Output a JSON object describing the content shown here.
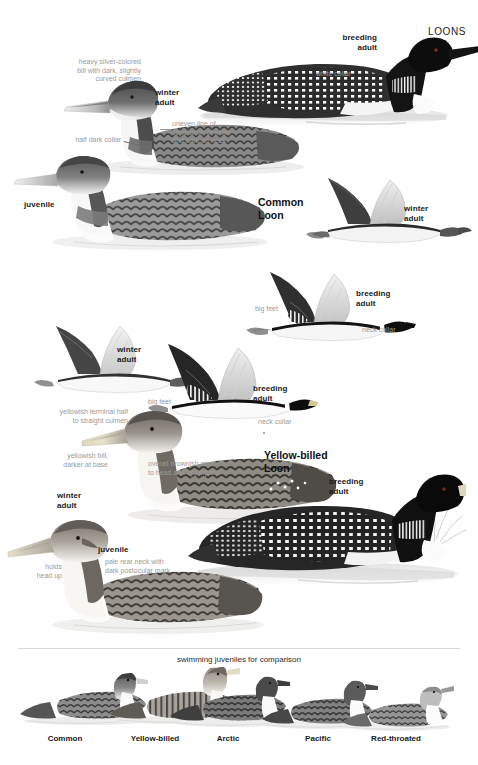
{
  "plate": {
    "title": "LOONS",
    "background": "#ffffff",
    "label_color": "#1a1a1a",
    "annotation_color": "#9a9a9a"
  },
  "species_headings": [
    {
      "name": "Common Loon",
      "text": "Common\nLoon"
    },
    {
      "name": "Yellow-billed Loon",
      "text": "Yellow-billed\nLoon"
    }
  ],
  "common_loon": {
    "breeding_adult_swimming": {
      "age_label": "breeding\nadult",
      "annotations": [
        {
          "name": "white-collar",
          "text": "white collar"
        }
      ]
    },
    "winter_adult_swimming": {
      "age_label": "winter\nadult",
      "annotations": [
        {
          "name": "bill-note",
          "text": "heavy silver-colored\nbill with dark, slightly\ncurved culmen"
        },
        {
          "name": "collar-note",
          "text": "half dark collar"
        },
        {
          "name": "neck-separation-note",
          "text": "uneven line of\nseparation of white\nand dark on neck"
        }
      ]
    },
    "juvenile_swimming": {
      "age_label": "juvenile"
    },
    "winter_adult_flight": {
      "age_label": "winter\nadult"
    },
    "breeding_adult_flight": {
      "age_label": "breeding\nadult",
      "annotations": [
        {
          "name": "big-feet",
          "text": "big feet"
        },
        {
          "name": "neck-collar",
          "text": "neck collar"
        }
      ]
    }
  },
  "yellow_billed_loon": {
    "winter_adult_flight": {
      "age_label": "winter\nadult"
    },
    "breeding_adult_flight": {
      "age_label": "breeding\nadult",
      "annotations": [
        {
          "name": "big-feet",
          "text": "big feet"
        },
        {
          "name": "neck-collar",
          "text": "neck collar"
        }
      ]
    },
    "winter_adult_swimming": {
      "age_label": "winter\nadult",
      "annotations": [
        {
          "name": "culmen-note",
          "text": "yellowish terminal half\nto straight culmen"
        },
        {
          "name": "bill-note",
          "text": "yellowish bill,\ndarker at base"
        },
        {
          "name": "brownish-cast-note",
          "text": "overall brownish cast\nto head and upperparts"
        }
      ]
    },
    "juvenile_swimming": {
      "age_label": "juvenile",
      "annotations": [
        {
          "name": "head-posture-note",
          "text": "holds\nhead up"
        },
        {
          "name": "rear-neck-note",
          "text": "pale rear neck with\ndark postocular mark"
        }
      ]
    },
    "breeding_adult_swimming": {
      "age_label": "breeding\nadult"
    }
  },
  "comparison": {
    "header": "swimming juveniles for comparison",
    "items": [
      {
        "label": "Common"
      },
      {
        "label": "Yellow-billed"
      },
      {
        "label": "Arctic"
      },
      {
        "label": "Pacific"
      },
      {
        "label": "Red-throated"
      }
    ]
  }
}
